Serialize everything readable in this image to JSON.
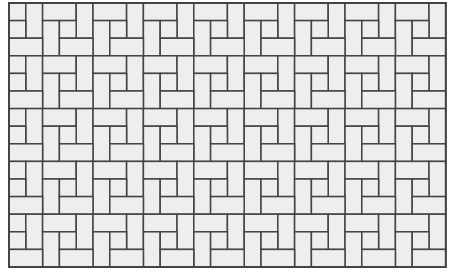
{
  "pattern": {
    "name": "pinwheel basket-weave tile pattern",
    "origin": [
      9,
      3
    ],
    "columns": 26,
    "rows": 15,
    "cell_width": 16.8,
    "cell_height": 17.6,
    "period": 3,
    "tile_types": [
      "square",
      "vertical-rect",
      "horizontal-rect"
    ],
    "colors": {
      "background": "#ffffff",
      "tile_fill": "#eeeeee",
      "grout": "#444444"
    },
    "grout_width": 1.5
  }
}
